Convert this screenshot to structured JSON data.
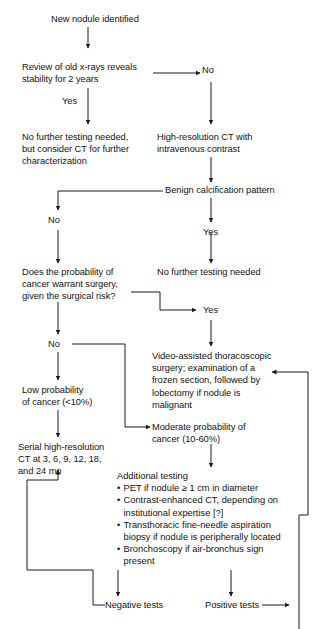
{
  "diagram": {
    "line_color": "#1a1a1a",
    "text_color": "#121212",
    "background": "#ffffff",
    "nodes": {
      "new_nodule": "New nodule identified",
      "review_xrays": "Review of old x-rays reveals\nstability for 2 years",
      "no_further_testing_1": "No further testing needed,\nbut consider CT for further\ncharacterization",
      "hrct": "High-resolution CT with\nintravenous contrast",
      "benign_calcification": "Benign calcification pattern",
      "no_further_testing_2": "No further testing needed",
      "probability_surgery": "Does the probability of\ncancer warrant surgery,\ngiven the surgical risk?",
      "vats": "Video-assisted thoracoscopic\nsurgery; examination of a\nfrozen section, followed by\nlobectomy if nodule is\nmalignant",
      "low_probability": "Low probability\nof cancer (<10%)",
      "moderate_probability": "Moderate probability of\ncancer (10-60%)",
      "serial_ct": "Serial high-resolution\nCT at 3, 6, 9, 12, 18,\nand 24 mo",
      "negative_tests": "Negative tests",
      "positive_tests": "Positive tests"
    },
    "additional_testing": {
      "heading": "Additional testing",
      "items": [
        "PET if nodule ≥ 1 cm in diameter",
        "Contrast-enhanced CT, depending on\ninstitutional expertise [?]",
        "Transthoracic fine-needle aspiration\nbiopsy if nodule is peripherally located",
        "Bronchoscopy if air-bronchus sign\npresent"
      ]
    },
    "edge_labels": {
      "xrays_no": "No",
      "xrays_yes": "Yes",
      "calcification_no": "No",
      "calcification_yes": "Yes",
      "surgery_yes": "Yes",
      "surgery_no": "No"
    }
  }
}
